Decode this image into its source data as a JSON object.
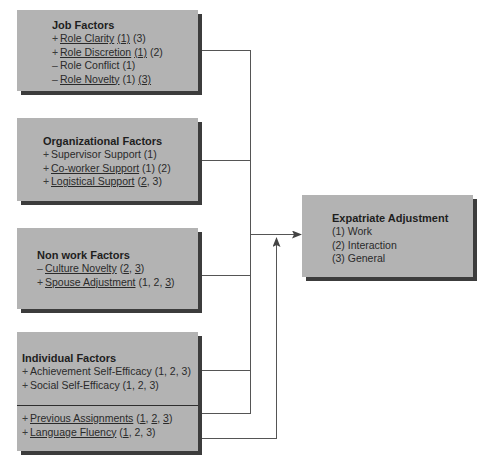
{
  "diagram": {
    "colors": {
      "box_fill": "#b3b3b3",
      "box_shadow": "#3c3c3c",
      "line": "#555555"
    },
    "job": {
      "title": "Job Factors",
      "items": [
        {
          "sign": "+",
          "name": "Role Clarity",
          "name_underlined": true,
          "refs": [
            {
              "t": "(1)",
              "u": true
            },
            {
              "t": " (3)",
              "u": false
            }
          ]
        },
        {
          "sign": "+",
          "name": "Role Discretion",
          "name_underlined": true,
          "refs": [
            {
              "t": "(1)",
              "u": true
            },
            {
              "t": " (2)",
              "u": false
            }
          ]
        },
        {
          "sign": "–",
          "name": "Role Conflict",
          "name_underlined": false,
          "refs": [
            {
              "t": "(1)",
              "u": false
            }
          ]
        },
        {
          "sign": "–",
          "name": "Role Novelty",
          "name_underlined": true,
          "refs": [
            {
              "t": "(1) ",
              "u": false
            },
            {
              "t": "(3)",
              "u": true
            }
          ]
        }
      ]
    },
    "organizational": {
      "title": "Organizational Factors",
      "items": [
        {
          "sign": "+",
          "name": "Supervisor Support",
          "name_underlined": false,
          "refs": [
            {
              "t": "(1)",
              "u": false
            }
          ]
        },
        {
          "sign": "+",
          "name": "Co-worker Support",
          "name_underlined": true,
          "refs": [
            {
              "t": "(1) (2)",
              "u": false
            }
          ]
        },
        {
          "sign": "+",
          "name": "Logistical Support",
          "name_underlined": true,
          "refs": [
            {
              "t": "(",
              "u": false
            },
            {
              "t": "2",
              "u": true
            },
            {
              "t": ", 3)",
              "u": false
            }
          ]
        }
      ]
    },
    "nonwork": {
      "title": "Non work Factors",
      "items": [
        {
          "sign": "–",
          "name": "Culture Novelty",
          "name_underlined": true,
          "refs": [
            {
              "t": "(",
              "u": false
            },
            {
              "t": "2",
              "u": true
            },
            {
              "t": ", ",
              "u": false
            },
            {
              "t": "3",
              "u": true
            },
            {
              "t": ")",
              "u": false
            }
          ]
        },
        {
          "sign": "+",
          "name": "Spouse Adjustment",
          "name_underlined": true,
          "refs": [
            {
              "t": "(1, 2, ",
              "u": false
            },
            {
              "t": "3",
              "u": true
            },
            {
              "t": ")",
              "u": false
            }
          ]
        }
      ]
    },
    "individual": {
      "title": "Individual Factors",
      "items_top": [
        {
          "sign": "+",
          "name": "Achievement Self-Efficacy",
          "name_underlined": false,
          "refs": [
            {
              "t": "(1, 2, 3)",
              "u": false
            }
          ]
        },
        {
          "sign": "+",
          "name": "Social Self-Efficacy",
          "name_underlined": false,
          "refs": [
            {
              "t": "(1, 2, 3)",
              "u": false
            }
          ]
        }
      ],
      "items_bottom": [
        {
          "sign": "+",
          "name": "Previous Assignments",
          "name_underlined": true,
          "refs": [
            {
              "t": "(",
              "u": false
            },
            {
              "t": "1",
              "u": true
            },
            {
              "t": ", ",
              "u": false
            },
            {
              "t": "2",
              "u": true
            },
            {
              "t": ", ",
              "u": false
            },
            {
              "t": "3",
              "u": true
            },
            {
              "t": ")",
              "u": false
            }
          ]
        },
        {
          "sign": "+",
          "name": "Language Fluency",
          "name_underlined": true,
          "refs": [
            {
              "t": "(",
              "u": false
            },
            {
              "t": "1",
              "u": true
            },
            {
              "t": ", 2, 3)",
              "u": false
            }
          ]
        }
      ]
    },
    "outcome": {
      "title": "Expatriate Adjustment",
      "items": [
        "(1) Work",
        "(2) Interaction",
        "(3) General"
      ]
    }
  }
}
